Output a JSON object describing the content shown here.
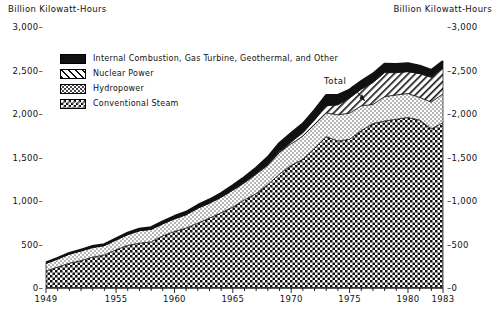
{
  "axis_titles": {
    "left": "Billion Kilowatt-Hours",
    "right": "Billion Kilowatt-Hours"
  },
  "legend": {
    "items": [
      {
        "label": "Internal Combustion, Gas Turbine, Geothermal, and Other",
        "pattern": "solid-black",
        "color": "#111111"
      },
      {
        "label": "Nuclear Power",
        "pattern": "diagonal-hatch",
        "color": "#ffffff"
      },
      {
        "label": "Hydropower",
        "pattern": "stipple",
        "color": "#ffffff"
      },
      {
        "label": "Conventional Steam",
        "pattern": "checkerboard",
        "color": "#ffffff"
      }
    ]
  },
  "annotations": {
    "total_label": "Total"
  },
  "chart_data": {
    "type": "area",
    "stacked": true,
    "title": "",
    "subtitle": "",
    "xlabel": "",
    "ylabel": "Billion Kilowatt-Hours",
    "xlim": [
      1949,
      1983
    ],
    "ylim": [
      0,
      3000
    ],
    "grid": false,
    "legend_position": "upper-left",
    "y_ticks": [
      0,
      500,
      1000,
      1500,
      2000,
      2500,
      3000
    ],
    "y_tick_labels_left": [
      "0",
      "500",
      "1,000",
      "1,500",
      "2,000",
      "2,500",
      "3,000"
    ],
    "y_tick_labels_right": [
      "0",
      "500",
      "1,000",
      "1,500",
      "2,000",
      "2,500",
      "3,000"
    ],
    "x_ticks": [
      1949,
      1955,
      1960,
      1965,
      1970,
      1975,
      1980,
      1983
    ],
    "x_tick_labels": [
      "1949",
      "1955",
      "1960",
      "1965",
      "1970",
      "1975",
      "1980",
      "1983"
    ],
    "x_minor_tick_interval": 1,
    "x": [
      1949,
      1950,
      1951,
      1952,
      1953,
      1954,
      1955,
      1956,
      1957,
      1958,
      1959,
      1960,
      1961,
      1962,
      1963,
      1964,
      1965,
      1966,
      1967,
      1968,
      1969,
      1970,
      1971,
      1972,
      1973,
      1974,
      1975,
      1976,
      1977,
      1978,
      1979,
      1980,
      1981,
      1982,
      1983
    ],
    "series": [
      {
        "name": "Conventional Steam",
        "pattern": "checkerboard",
        "values": [
          195,
          240,
          285,
          315,
          355,
          380,
          440,
          490,
          515,
          530,
          600,
          650,
          690,
          745,
          805,
          865,
          930,
          1015,
          1085,
          1190,
          1310,
          1410,
          1480,
          1605,
          1740,
          1690,
          1710,
          1810,
          1890,
          1920,
          1940,
          1960,
          1930,
          1830,
          1900
        ]
      },
      {
        "name": "Hydropower",
        "pattern": "stipple",
        "values": [
          90,
          96,
          105,
          112,
          112,
          108,
          113,
          125,
          144,
          145,
          138,
          146,
          152,
          172,
          170,
          178,
          194,
          195,
          222,
          222,
          250,
          248,
          266,
          273,
          272,
          301,
          300,
          284,
          220,
          280,
          280,
          276,
          261,
          309,
          332
        ]
      },
      {
        "name": "Nuclear Power",
        "pattern": "diagonal-hatch",
        "values": [
          0,
          0,
          0,
          0,
          0,
          0,
          0,
          0,
          0,
          0,
          0,
          1,
          2,
          2,
          3,
          3,
          4,
          6,
          8,
          13,
          14,
          22,
          38,
          54,
          83,
          114,
          173,
          191,
          251,
          276,
          255,
          251,
          273,
          283,
          294
        ]
      },
      {
        "name": "Internal Combustion, Gas Turbine, Geothermal, and Other",
        "pattern": "solid-black",
        "values": [
          6,
          8,
          10,
          12,
          13,
          14,
          16,
          18,
          20,
          22,
          25,
          28,
          30,
          33,
          37,
          42,
          50,
          58,
          66,
          78,
          92,
          100,
          104,
          110,
          120,
          112,
          95,
          92,
          100,
          100,
          98,
          95,
          88,
          82,
          80
        ]
      }
    ],
    "total_values": [
      291,
      344,
      400,
      439,
      480,
      502,
      569,
      633,
      679,
      697,
      763,
      825,
      874,
      952,
      1015,
      1088,
      1178,
      1274,
      1381,
      1503,
      1666,
      1780,
      1888,
      2042,
      2215,
      2217,
      2278,
      2377,
      2461,
      2576,
      2573,
      2582,
      2552,
      2504,
      2606
    ]
  }
}
